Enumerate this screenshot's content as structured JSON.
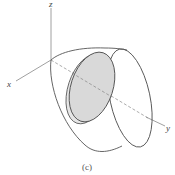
{
  "figure": {
    "caption": "(c)",
    "axes": {
      "x_label": "x",
      "y_label": "y",
      "z_label": "z"
    },
    "colors": {
      "stroke": "#555555",
      "axis": "#777777",
      "disk_fill": "#d9d9d9",
      "background": "#ffffff"
    }
  }
}
